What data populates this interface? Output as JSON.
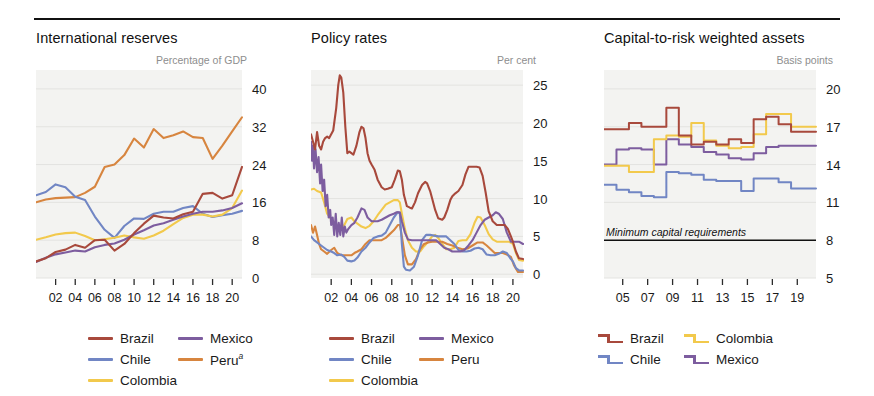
{
  "figure": {
    "panel_count": 3,
    "colors": {
      "brazil": "#a8493c",
      "chile": "#7186c4",
      "colombia": "#f2c94c",
      "mexico": "#7d5d9f",
      "peru": "#d7853f"
    }
  },
  "chart_data": [
    {
      "type": "line",
      "title": "International reserves",
      "ylabel": "Percentage of GDP",
      "xlabel": "",
      "ylim": [
        0,
        44
      ],
      "yticks": [
        0,
        8,
        16,
        24,
        32,
        40
      ],
      "ytick_labels": [
        "0",
        "8",
        "16",
        "24",
        "32",
        "40"
      ],
      "xticks": [
        "02",
        "04",
        "06",
        "08",
        "10",
        "12",
        "14",
        "16",
        "18",
        "20"
      ],
      "x": [
        2000,
        2001,
        2002,
        2003,
        2004,
        2005,
        2006,
        2007,
        2008,
        2009,
        2010,
        2011,
        2012,
        2013,
        2014,
        2015,
        2016,
        2017,
        2018,
        2019,
        2020,
        2021
      ],
      "grid": true,
      "legend_position": "below",
      "series": [
        {
          "name": "Brazil",
          "color": "#a8493c",
          "values": [
            3.5,
            4.2,
            5.5,
            6.0,
            7.0,
            6.4,
            8.0,
            8.1,
            5.8,
            7.2,
            9.5,
            11.5,
            13.2,
            12.8,
            12.6,
            13.5,
            14.0,
            17.8,
            18.0,
            16.8,
            17.5,
            23.5
          ]
        },
        {
          "name": "Chile",
          "color": "#7186c4",
          "values": [
            17.5,
            18.2,
            19.8,
            19.2,
            17.2,
            16.5,
            13.0,
            10.2,
            8.5,
            11.0,
            12.6,
            12.5,
            13.6,
            14.0,
            14.0,
            14.8,
            15.2,
            13.6,
            12.9,
            13.3,
            13.6,
            14.2
          ]
        },
        {
          "name": "Colombia",
          "color": "#f2c94c",
          "values": [
            8.1,
            8.6,
            9.2,
            9.5,
            9.6,
            8.9,
            8.0,
            8.2,
            8.5,
            9.0,
            8.6,
            8.3,
            9.0,
            10.0,
            11.4,
            12.7,
            13.4,
            13.4,
            13.0,
            13.4,
            14.8,
            18.5
          ]
        },
        {
          "name": "Mexico",
          "color": "#7d5d9f",
          "values": [
            3.4,
            4.3,
            5.0,
            5.4,
            5.8,
            5.6,
            6.5,
            7.0,
            7.3,
            8.1,
            9.2,
            10.1,
            11.1,
            11.6,
            12.3,
            13.0,
            13.6,
            14.0,
            14.0,
            14.3,
            14.8,
            15.8
          ]
        },
        {
          "name": "Peru",
          "color": "#d7853f",
          "values": [
            16.0,
            16.6,
            16.9,
            17.0,
            17.1,
            18.0,
            19.3,
            23.5,
            24.0,
            26.0,
            29.5,
            27.6,
            31.5,
            29.6,
            30.2,
            31.0,
            29.8,
            29.6,
            25.2,
            28.0,
            31.0,
            34.0
          ]
        }
      ]
    },
    {
      "type": "line",
      "title": "Policy rates",
      "ylabel": "Per cent",
      "xlabel": "",
      "ylim": [
        -0.5,
        27
      ],
      "yticks": [
        0,
        5,
        10,
        15,
        20,
        25
      ],
      "ytick_labels": [
        "0",
        "5",
        "10",
        "15",
        "20",
        "25"
      ],
      "xticks": [
        "02",
        "04",
        "06",
        "08",
        "10",
        "12",
        "14",
        "16",
        "18",
        "20"
      ],
      "grid": true,
      "legend_position": "below",
      "series": [
        {
          "name": "Brazil",
          "color": "#a8493c"
        },
        {
          "name": "Chile",
          "color": "#7186c4"
        },
        {
          "name": "Colombia",
          "color": "#f2c94c"
        },
        {
          "name": "Mexico",
          "color": "#7d5d9f"
        },
        {
          "name": "Peru",
          "color": "#d7853f"
        }
      ],
      "notes": "Brazil peaks ~26 in 2003, falls to ~2 by 2021; Colombia starts ~11; Mexico spikes early ~17."
    },
    {
      "type": "line",
      "title": "Capital-to-risk weighted assets",
      "ylabel": "Basis points",
      "xlabel": "",
      "ylim": [
        5,
        21.5
      ],
      "yticks": [
        5,
        8,
        11,
        14,
        17,
        20
      ],
      "ytick_labels": [
        "5",
        "8",
        "11",
        "14",
        "17",
        "20"
      ],
      "xticks": [
        "05",
        "07",
        "09",
        "11",
        "13",
        "15",
        "17",
        "19"
      ],
      "x": [
        2004,
        2005,
        2006,
        2007,
        2008,
        2009,
        2010,
        2011,
        2012,
        2013,
        2014,
        2015,
        2016,
        2017,
        2018,
        2019,
        2020
      ],
      "grid": true,
      "legend_position": "below",
      "annotation": "Minimum capital requirements",
      "annotation_value": 8,
      "series": [
        {
          "name": "Brazil",
          "color": "#a8493c",
          "step": true,
          "values": [
            16.8,
            16.8,
            17.3,
            17.0,
            17.0,
            18.5,
            16.3,
            15.6,
            15.8,
            15.6,
            16.0,
            15.7,
            17.6,
            17.8,
            17.2,
            16.6,
            16.6
          ]
        },
        {
          "name": "Chile",
          "color": "#7186c4",
          "step": true,
          "values": [
            12.4,
            12.0,
            11.8,
            11.5,
            11.4,
            13.4,
            13.3,
            13.2,
            12.8,
            12.7,
            12.7,
            11.9,
            12.9,
            12.9,
            12.6,
            12.1,
            12.1
          ]
        },
        {
          "name": "Colombia",
          "color": "#f2c94c",
          "step": true,
          "values": [
            13.9,
            13.9,
            13.4,
            13.4,
            16.0,
            16.3,
            16.2,
            17.3,
            15.9,
            15.5,
            15.3,
            15.4,
            16.4,
            18.0,
            18.0,
            17.0,
            17.0
          ]
        },
        {
          "name": "Mexico",
          "color": "#7d5d9f",
          "step": true,
          "values": [
            14.0,
            15.2,
            15.3,
            15.2,
            14.0,
            16.0,
            15.6,
            15.4,
            15.0,
            14.8,
            14.5,
            14.4,
            14.9,
            15.4,
            15.5,
            15.5,
            15.5
          ]
        }
      ]
    }
  ],
  "legends": [
    {
      "panel": "International reserves",
      "columns": [
        [
          {
            "label": "Brazil",
            "color": "#a8493c",
            "sup": ""
          },
          {
            "label": "Chile",
            "color": "#7186c4",
            "sup": ""
          },
          {
            "label": "Colombia",
            "color": "#f2c94c",
            "sup": ""
          }
        ],
        [
          {
            "label": "Mexico",
            "color": "#7d5d9f",
            "sup": ""
          },
          {
            "label": "Peru",
            "color": "#d7853f",
            "sup": "a"
          }
        ]
      ]
    },
    {
      "panel": "Policy rates",
      "columns": [
        [
          {
            "label": "Brazil",
            "color": "#a8493c",
            "sup": ""
          },
          {
            "label": "Chile",
            "color": "#7186c4",
            "sup": ""
          },
          {
            "label": "Colombia",
            "color": "#f2c94c",
            "sup": ""
          }
        ],
        [
          {
            "label": "Mexico",
            "color": "#7d5d9f",
            "sup": ""
          },
          {
            "label": "Peru",
            "color": "#d7853f",
            "sup": ""
          }
        ]
      ]
    },
    {
      "panel": "Capital-to-risk weighted assets",
      "columns": [
        [
          {
            "label": "Brazil",
            "color": "#a8493c",
            "sup": ""
          },
          {
            "label": "Chile",
            "color": "#7186c4",
            "sup": ""
          }
        ],
        [
          {
            "label": "Colombia",
            "color": "#f2c94c",
            "sup": ""
          },
          {
            "label": "Mexico",
            "color": "#7d5d9f",
            "sup": ""
          }
        ]
      ]
    }
  ]
}
